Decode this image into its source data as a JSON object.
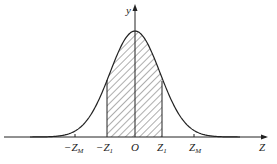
{
  "figure": {
    "type": "normal-distribution-curve",
    "axes": {
      "x_label": "Z",
      "y_label": "y",
      "origin_label": "O"
    },
    "ticks": [
      {
        "id": "neg_zm",
        "label": "−Z",
        "sub": "M",
        "position": -2.4
      },
      {
        "id": "neg_z1",
        "label": "−Z",
        "sub": "1",
        "position": -1.1
      },
      {
        "id": "origin",
        "label": "O",
        "sub": "",
        "position": 0
      },
      {
        "id": "z1",
        "label": "Z",
        "sub": "1",
        "position": 1.1
      },
      {
        "id": "zm",
        "label": "Z",
        "sub": "M",
        "position": 2.4
      }
    ],
    "shaded_region": {
      "from": "−Z1",
      "to": "Z1",
      "style": "diagonal-hatch"
    },
    "colors": {
      "line": "#222222",
      "background": "#ffffff"
    }
  }
}
